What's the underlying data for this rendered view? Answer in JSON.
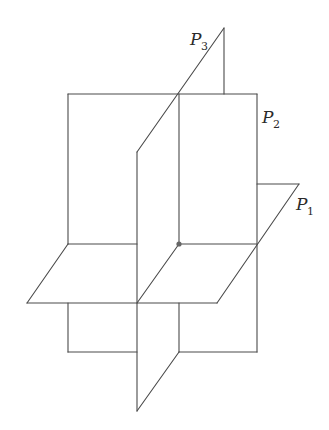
{
  "diagram": {
    "type": "three-intersecting-planes",
    "colors": {
      "line": "#4a4a4a",
      "point": "#666666",
      "background": "#ffffff"
    },
    "planes": [
      {
        "id": "P1",
        "label": "P",
        "subscript": "1",
        "orientation": "horizontal"
      },
      {
        "id": "P2",
        "label": "P",
        "subscript": "2",
        "orientation": "vertical-frontal"
      },
      {
        "id": "P3",
        "label": "P",
        "subscript": "3",
        "orientation": "vertical-oblique"
      }
    ],
    "intersection_point": {
      "label": "",
      "x": 179,
      "y": 244
    }
  }
}
